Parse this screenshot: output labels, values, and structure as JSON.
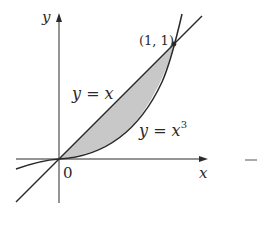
{
  "diagram": {
    "title": "",
    "axes": {
      "x_label": "x",
      "y_label": "y",
      "origin_label": "0"
    },
    "curves": [
      {
        "name": "line",
        "equation_text": "y = x",
        "label_base": "y = x"
      },
      {
        "name": "cubic",
        "equation_text": "y = x^3",
        "label_base": "y = x",
        "label_exponent": "3"
      }
    ],
    "intersection_point": {
      "label": "(1, 1)",
      "x": 1,
      "y": 1
    },
    "shaded_region": {
      "between": [
        "y = x",
        "y = x^3"
      ],
      "x_from": 0,
      "x_to": 1,
      "fill": "#c8c8c8"
    },
    "colors": {
      "stroke": "#2a2a2a",
      "shade": "#c8c8c8",
      "background": "#ffffff"
    }
  }
}
